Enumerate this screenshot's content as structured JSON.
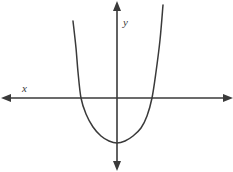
{
  "figure": {
    "background_color": "#ffffff",
    "stroke_color": "#3a3a3a",
    "width": 233,
    "height": 172
  },
  "axes": {
    "x_axis": {
      "label": "x",
      "label_x": 22,
      "label_y": 92,
      "y_position": 98,
      "x_start": 6,
      "x_end": 229,
      "arrow_left": true,
      "arrow_right": true
    },
    "y_axis": {
      "label": "y",
      "label_x": 123,
      "label_y": 26,
      "x_position": 117,
      "y_start": 5,
      "y_end": 166,
      "arrow_up": true,
      "arrow_down": true
    },
    "origin": {
      "x": 117,
      "y": 98
    }
  },
  "chart_data": {
    "type": "line",
    "xlabel": "x",
    "ylabel": "y",
    "grid": false,
    "legend": null,
    "curve": {
      "name": "parabola",
      "opens": "up",
      "vertex_px": {
        "x": 117,
        "y": 143
      },
      "x_intercepts_px": [
        81,
        152
      ],
      "left_branch_top_px": {
        "x": 73,
        "y": 21
      },
      "right_branch_top_px": {
        "x": 163,
        "y": 5
      },
      "points_px": [
        {
          "x": 73,
          "y": 21
        },
        {
          "x": 76,
          "y": 48
        },
        {
          "x": 78,
          "y": 72
        },
        {
          "x": 81,
          "y": 98
        },
        {
          "x": 86,
          "y": 114
        },
        {
          "x": 93,
          "y": 127
        },
        {
          "x": 101,
          "y": 136
        },
        {
          "x": 109,
          "y": 141
        },
        {
          "x": 117,
          "y": 143
        },
        {
          "x": 125,
          "y": 141
        },
        {
          "x": 133,
          "y": 136
        },
        {
          "x": 141,
          "y": 128
        },
        {
          "x": 147,
          "y": 116
        },
        {
          "x": 152,
          "y": 98
        },
        {
          "x": 156,
          "y": 72
        },
        {
          "x": 160,
          "y": 40
        },
        {
          "x": 163,
          "y": 5
        }
      ]
    }
  },
  "icons": {
    "arrow_left": "arrow-left-icon",
    "arrow_right": "arrow-right-icon",
    "arrow_up": "arrow-up-icon",
    "arrow_down": "arrow-down-icon"
  }
}
